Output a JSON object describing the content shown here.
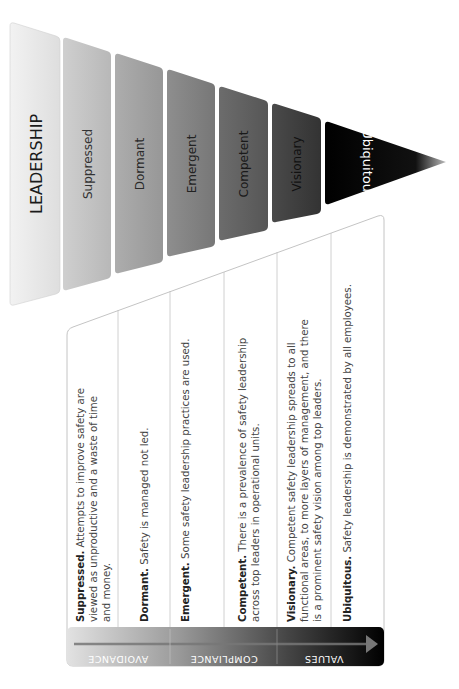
{
  "diagram": {
    "title": "LEADERSHIP",
    "levels": [
      {
        "label": "Suppressed",
        "color_top": "#c9c9c9",
        "color_bottom": "#b6b6b6",
        "text_color": "#333333"
      },
      {
        "label": "Dormant",
        "color_top": "#a7a7a7",
        "color_bottom": "#989898",
        "text_color": "#2a2a2a"
      },
      {
        "label": "Emergent",
        "color_top": "#8a8a8a",
        "color_bottom": "#7a7a7a",
        "text_color": "#222222"
      },
      {
        "label": "Competent",
        "color_top": "#6a6a6a",
        "color_bottom": "#5a5a5a",
        "text_color": "#1a1a1a"
      },
      {
        "label": "Visionary",
        "color_top": "#444444",
        "color_bottom": "#363636",
        "text_color": "#111111"
      },
      {
        "label": "Ubiquitous",
        "color_top": "#111111",
        "color_bottom": "#000000",
        "text_color": "#ffffff"
      }
    ],
    "descriptions": [
      {
        "term": "Suppressed.",
        "lines": [
          " Attempts to improve safety are",
          "viewed as unproductive and a waste of time",
          "and money."
        ]
      },
      {
        "term": "Dormant.",
        "lines": [
          " Safety is managed not led."
        ]
      },
      {
        "term": "Emergent.",
        "lines": [
          " Some safety leadership practices are used."
        ]
      },
      {
        "term": "Competent.",
        "lines": [
          " There is a prevalence of safety leadership",
          "across top leaders in operational units."
        ]
      },
      {
        "term": "Visionary.",
        "lines": [
          " Competent safety leadership spreads to all",
          "functional areas, to more layers of management, and there",
          "is a prominent safety vision among top leaders."
        ]
      },
      {
        "term": "Ubiquitous.",
        "lines": [
          " Safety leadership is demonstrated by all employees."
        ]
      }
    ],
    "stages": [
      {
        "label": "AVOIDANCE"
      },
      {
        "label": "COMPLIANCE"
      },
      {
        "label": "VALUES"
      }
    ],
    "colors": {
      "table_border": "#bdbdbd",
      "stage_bar_start": "#dcdcdc",
      "stage_bar_end": "#000000"
    }
  }
}
